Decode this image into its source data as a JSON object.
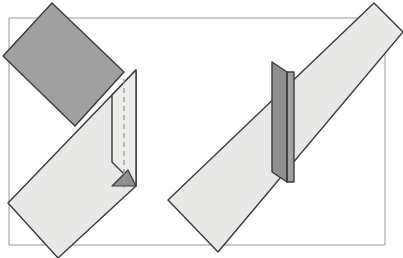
{
  "figure": {
    "width": 403,
    "height": 258,
    "background_color": "#ffffff"
  },
  "palette": {
    "dark_face": "#a0a0a0",
    "dark_face_shade": "#909090",
    "light_face": "#e8e8e6",
    "light_face_alt": "#ececea",
    "outline": "#3a3a3a",
    "thin_outline": "#8a8a8a",
    "crease_dash": "#9a9a9a",
    "background": "#ffffff"
  },
  "shapes": {
    "frame_rectangle": {
      "label": "reference-plane-rectangle",
      "stroke": "#9a9a9a",
      "stroke_width": 1,
      "fill": "none",
      "points": "9,18 385,18 385,245 9,245"
    },
    "left_figure": {
      "label": "left-folded-sheet",
      "dark_panel": {
        "label": "dark-reverse-face",
        "fill": "#a0a0a0",
        "stroke": "#3a3a3a",
        "points": "52,3 124,72 75,126 3,56"
      },
      "light_panel": {
        "label": "light-front-face",
        "fill": "#e8e8e6",
        "stroke": "#3a3a3a",
        "points": "136,70 136,186 58,258 8,203"
      },
      "flap_panel": {
        "label": "bent-flap-face",
        "fill": "#ececea",
        "stroke": "#3a3a3a",
        "points": "136,70 136,186 112,162 112,95"
      },
      "flap_shadow": {
        "label": "flap-underside-wedge",
        "fill": "#909090",
        "stroke": "#3a3a3a",
        "points": "136,186 112,186 128,170"
      },
      "crease_line": {
        "label": "vertical-crease-dashed",
        "stroke": "#9a9a9a",
        "dash": "5 4",
        "x1": 124,
        "y1": 79,
        "x2": 124,
        "y2": 188
      }
    },
    "right_figure": {
      "label": "right-band-through-fold",
      "band": {
        "label": "light-band-face",
        "fill": "#e8e8e6",
        "stroke": "#3a3a3a",
        "points": "374,3 403,32 218,252 168,200"
      },
      "dark_panel_left": {
        "label": "dark-fold-panel-left",
        "fill": "#909090",
        "stroke": "#3a3a3a",
        "points": "272,62 287,72 287,182 272,172"
      },
      "dark_panel_right": {
        "label": "dark-fold-panel-right",
        "fill": "#a0a0a0",
        "stroke": "#3a3a3a",
        "points": "287,72 294,72 294,182 287,182"
      },
      "panel_spine": {
        "label": "fold-spine-line",
        "stroke": "#3a3a3a",
        "x1": 287,
        "y1": 72,
        "x2": 287,
        "y2": 182
      }
    }
  },
  "corner_marks": [
    {
      "label": "frame-top-right-corner-tick",
      "x": 381,
      "y": 22,
      "size": 6
    }
  ]
}
